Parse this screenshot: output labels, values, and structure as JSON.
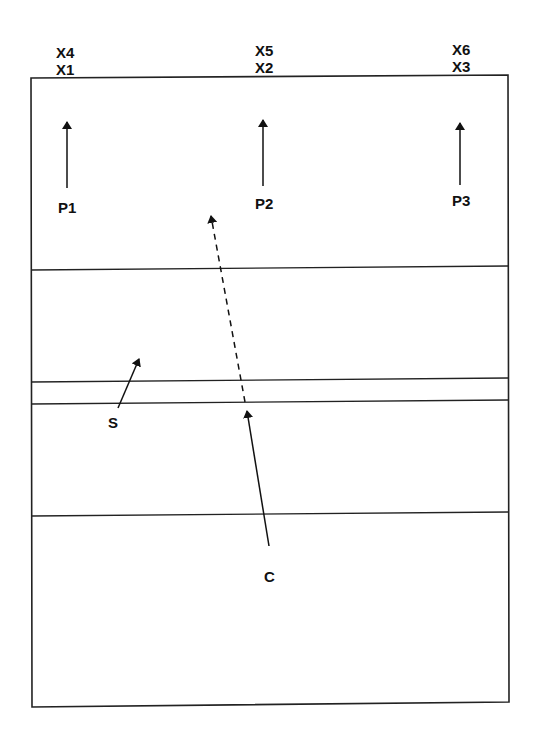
{
  "diagram": {
    "type": "volleyball-court-play-diagram",
    "colors": {
      "line": "#222222",
      "background": "#ffffff",
      "text": "#111111"
    },
    "labels": {
      "x4": "X4",
      "x1": "X1",
      "x5": "X5",
      "x2": "X2",
      "x6": "X6",
      "x3": "X3",
      "p1": "P1",
      "p2": "P2",
      "p3": "P3",
      "s": "S",
      "c": "C"
    },
    "court": {
      "outline": [
        [
          31,
          78
        ],
        [
          508,
          75
        ],
        [
          509,
          702
        ],
        [
          32,
          707
        ]
      ],
      "horizontal_lines": [
        {
          "y_left": 270,
          "y_right": 266
        },
        {
          "y_left": 382,
          "y_right": 378
        },
        {
          "y_left": 404,
          "y_right": 400
        },
        {
          "y_left": 516,
          "y_right": 512
        }
      ]
    },
    "arrows": [
      {
        "name": "p1-arrow",
        "from": [
          67,
          188
        ],
        "to": [
          67,
          122
        ],
        "style": "solid"
      },
      {
        "name": "p2-arrow",
        "from": [
          263,
          186
        ],
        "to": [
          263,
          120
        ],
        "style": "solid"
      },
      {
        "name": "p3-arrow",
        "from": [
          460,
          185
        ],
        "to": [
          460,
          123
        ],
        "style": "solid"
      },
      {
        "name": "s-arrow",
        "from": [
          118,
          408
        ],
        "to": [
          139,
          358
        ],
        "style": "solid"
      },
      {
        "name": "c-arrow",
        "from": [
          269,
          546
        ],
        "to": [
          247,
          410
        ],
        "style": "solid"
      },
      {
        "name": "c-dashed-path",
        "from": [
          245,
          402
        ],
        "to": [
          210,
          215
        ],
        "style": "dashed"
      }
    ]
  }
}
